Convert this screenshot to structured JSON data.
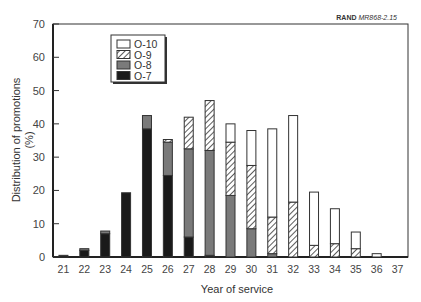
{
  "source_tag": {
    "bold": "RAND",
    "italic": "MR868-2.15"
  },
  "chart_data": {
    "type": "bar",
    "stacked": true,
    "title": "",
    "xlabel": "Year of service",
    "ylabel": "Distribution of promotions (%)",
    "ylabel_line1": "Distribution of promotions",
    "ylabel_line2": "(%)",
    "ylim": [
      0,
      70
    ],
    "yticks": [
      0,
      10,
      20,
      30,
      40,
      50,
      60,
      70
    ],
    "grid": false,
    "legend_position": "upper-left (inside)",
    "categories": [
      "21",
      "22",
      "23",
      "24",
      "25",
      "26",
      "27",
      "28",
      "29",
      "30",
      "31",
      "32",
      "33",
      "34",
      "35",
      "36",
      "37"
    ],
    "series": [
      {
        "name": "O-7",
        "style": "solid-black",
        "color": "#1a1a1a",
        "values": [
          0.5,
          2,
          7,
          19.3,
          38.5,
          24.5,
          6,
          0.5,
          0,
          0,
          0,
          0,
          0,
          0,
          0,
          0,
          0
        ]
      },
      {
        "name": "O-8",
        "style": "solid-gray",
        "color": "#7a7a7a",
        "values": [
          0,
          0.5,
          0.8,
          0,
          4,
          10,
          26.5,
          31.5,
          18.5,
          8.5,
          1,
          0,
          0,
          0,
          0,
          0,
          0
        ]
      },
      {
        "name": "O-9",
        "style": "hatched",
        "color": "#ffffff",
        "values": [
          0,
          0,
          0,
          0,
          0,
          0.8,
          9.5,
          15,
          16,
          19,
          11,
          16.5,
          3.5,
          4,
          2.5,
          0,
          0
        ]
      },
      {
        "name": "O-10",
        "style": "white",
        "color": "#ffffff",
        "values": [
          0,
          0,
          0,
          0,
          0,
          0,
          0,
          0,
          5.5,
          10.5,
          26.5,
          26,
          16,
          10.5,
          5,
          1,
          0
        ]
      }
    ],
    "totals": [
      0.5,
      2.5,
      7.8,
      19.3,
      42.5,
      35.3,
      42,
      47,
      40,
      38,
      38.5,
      42.5,
      19.5,
      14.5,
      7.5,
      1,
      0
    ],
    "legend": [
      "O-10",
      "O-9",
      "O-8",
      "O-7"
    ]
  }
}
